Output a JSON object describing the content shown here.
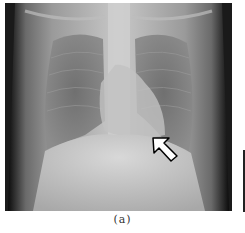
{
  "figure": {
    "caption": "(a)",
    "image_description": "Frontal chest radiograph",
    "annotation": {
      "type": "arrow",
      "color": "#ffffff",
      "outline": "#000000",
      "direction": "up-left"
    }
  }
}
